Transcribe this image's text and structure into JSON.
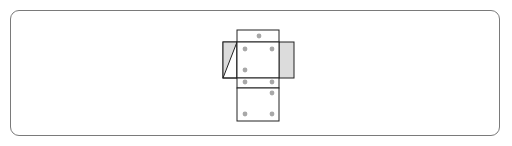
{
  "diagram": {
    "type": "cube-net",
    "colors": {
      "line": "#222222",
      "dot": "#a8a8a8",
      "flap_fill": "#dcdcdc",
      "frame": "#7a7a7a"
    },
    "faces": [
      {
        "name": "top-face",
        "dots": 1
      },
      {
        "name": "center-face",
        "dots": 3
      },
      {
        "name": "strip-face",
        "dots": 2
      },
      {
        "name": "bottom-face",
        "dots": 3
      },
      {
        "name": "left-flap",
        "dots": 0
      },
      {
        "name": "right-flap",
        "dots": 0
      }
    ]
  }
}
